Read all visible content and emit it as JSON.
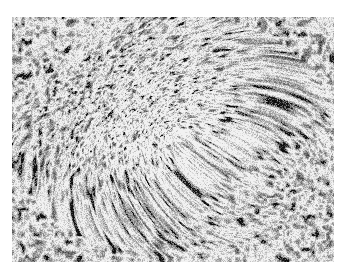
{
  "image": {
    "description": "Grayscale light micrograph of a tissue section showing dense, irregular cellular texture with darker periphery and a lighter, finer-grained central region",
    "colors": {
      "background": "#ffffff",
      "mid_gray": "#8a8a8a",
      "dark": "#1e1e1e",
      "light": "#e6e6e6"
    }
  }
}
